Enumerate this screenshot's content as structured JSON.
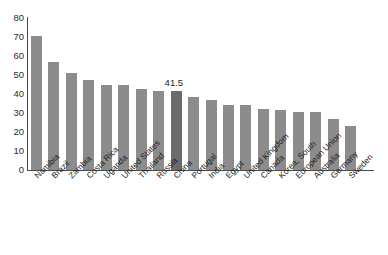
{
  "chart_data": {
    "type": "bar",
    "title": "",
    "subtitle": "",
    "xlabel": "",
    "ylabel": "",
    "ylim": [
      0,
      80
    ],
    "ytick_step": 10,
    "yticks": [
      80,
      70,
      60,
      50,
      40,
      30,
      20,
      10,
      0
    ],
    "grid": false,
    "legend": false,
    "orientation": "vertical",
    "categories": [
      "Namibia",
      "Brazil",
      "Zambia",
      "Costa Rica",
      "Uganda",
      "United States",
      "Thailand",
      "Russia",
      "China",
      "Portugal",
      "India",
      "Egypt",
      "United Kingdom",
      "Canada",
      "Korea, South",
      "European Union",
      "Australia",
      "Germany",
      "Sweden"
    ],
    "values": [
      70.7,
      56.7,
      50.8,
      47.2,
      44.6,
      45.0,
      42.5,
      41.5,
      41.5,
      38.5,
      36.8,
      34.4,
      34.0,
      32.1,
      31.6,
      30.5,
      30.5,
      27.0,
      23.0
    ],
    "annotations": [
      {
        "category": "China",
        "text": "41.5",
        "index": 8
      }
    ],
    "highlight_index": 8,
    "colors": {
      "bar": "#8c8c8c",
      "bar_highlight": "#6b6b6b",
      "axis": "#4a4a4a",
      "text": "#1f1f1f",
      "background": "#ffffff"
    }
  }
}
